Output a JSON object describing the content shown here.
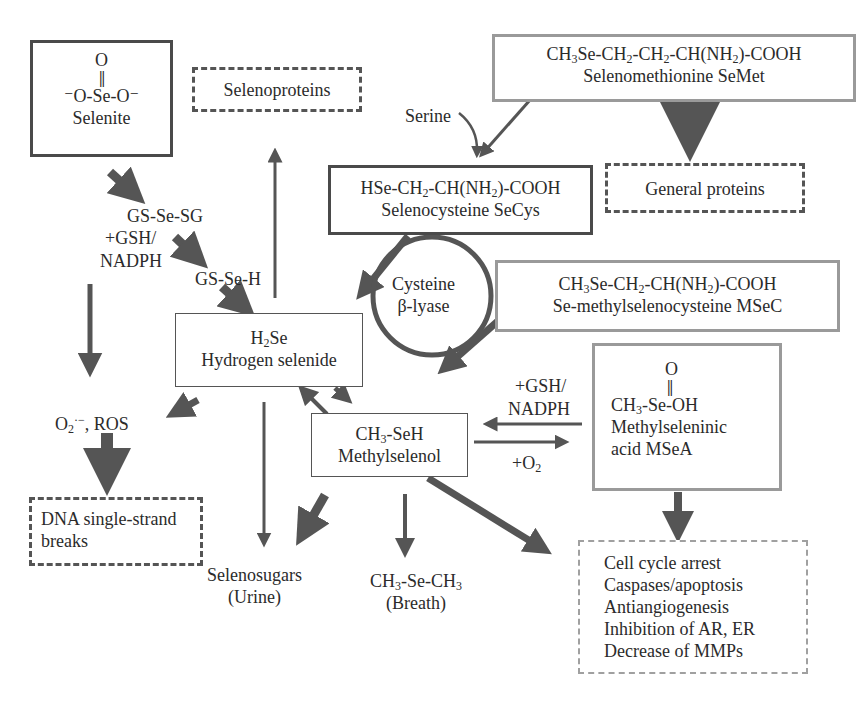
{
  "diagram": {
    "colors": {
      "arrow": "#555555",
      "box_dark": "#4a4a4a",
      "box_gray": "#9a9a9a"
    },
    "nodes": {
      "selenite": {
        "o_top": "O",
        "formula_pre": "⁻O-Se-O⁻",
        "name": "Selenite"
      },
      "selenoproteins": {
        "name": "Selenoproteins"
      },
      "semet": {
        "formula": {
          "a": "CH",
          "b": "3",
          "c": "Se-CH",
          "d": "2",
          "e": "-CH",
          "f": "2",
          "g": "-CH(NH",
          "h": "2",
          "i": ")-COOH"
        },
        "name": "Selenomethionine SeMet"
      },
      "general_proteins": {
        "name": "General proteins"
      },
      "secys": {
        "formula": {
          "a": "HSe-CH",
          "b": "2",
          "c": "-CH(NH",
          "d": "2",
          "e": ")-COOH"
        },
        "name": "Selenocysteine SeCys"
      },
      "lyase": {
        "line1": "Cysteine",
        "line2": "β-lyase"
      },
      "msec": {
        "formula": {
          "a": "CH",
          "b": "3",
          "c": "Se-CH",
          "d": "2",
          "e": "-CH(NH",
          "f": "2",
          "g": ")-COOH"
        },
        "name": "Se-methylselenocysteine MSeC"
      },
      "h2se": {
        "formula": {
          "a": "H",
          "b": "2",
          "c": "Se"
        },
        "name": "Hydrogen selenide"
      },
      "methylselenol": {
        "formula": {
          "a": "CH",
          "b": "3",
          "c": "-SeH"
        },
        "name": "Methylselenol"
      },
      "msea": {
        "o_top": "O",
        "formula": {
          "a": "CH",
          "b": "3",
          "c": "-Se-OH"
        },
        "name_line1": "Methylseleninic",
        "name_line2": "acid MSeA"
      },
      "dna_breaks": {
        "line1": "DNA single-strand",
        "line2": "breaks"
      },
      "effects": {
        "items": [
          "Cell cycle arrest",
          "Caspases/apoptosis",
          "Antiangiogenesis",
          "Inhibition of AR, ER",
          "Decrease of MMPs"
        ]
      }
    },
    "labels": {
      "serine": "Serine",
      "gs_se_sg": "GS-Se-SG",
      "gsh_nadph_left_1": "+GSH/",
      "gsh_nadph_left_2": "NADPH",
      "gs_se_h": "GS-Se-H",
      "ros": {
        "a": "O",
        "b": "2",
        "c": "·−",
        "d": ", ROS"
      },
      "gsh_nadph_right_1": "+GSH/",
      "gsh_nadph_right_2": "NADPH",
      "o2": {
        "a": "+O",
        "b": "2"
      },
      "selenosugars_1": "Selenosugars",
      "selenosugars_2": "(Urine)",
      "dimethylselenide": {
        "a": "CH",
        "b": "3",
        "c": "-Se-CH",
        "d": "3"
      },
      "breath": "(Breath)"
    }
  }
}
